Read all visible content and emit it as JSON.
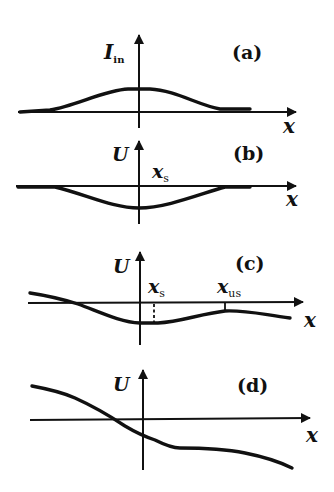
{
  "figure": {
    "panels": [
      {
        "id": "a",
        "panel_label": "(a)",
        "y_axis_label_main": "I",
        "y_axis_label_sub": "in",
        "x_axis_label": "x",
        "description": "Bell-shaped positive bump centered at origin"
      },
      {
        "id": "b",
        "panel_label": "(b)",
        "y_axis_label_main": "U",
        "x_axis_label": "x",
        "marker_main": "x",
        "marker_sub": "s",
        "description": "Symmetric negative well centered at origin (stable point x_s at origin)"
      },
      {
        "id": "c",
        "panel_label": "(c)",
        "y_axis_label_main": "U",
        "x_axis_label": "x",
        "marker_1_main": "x",
        "marker_1_sub": "s",
        "marker_2_main": "x",
        "marker_2_sub": "us",
        "description": "Tilted potential with local minimum x_s slightly right of origin and local maximum x_us further right"
      },
      {
        "id": "d",
        "panel_label": "(d)",
        "y_axis_label_main": "U",
        "x_axis_label": "x",
        "description": "Monotonically decreasing potential with a shoulder, no extrema"
      }
    ]
  }
}
